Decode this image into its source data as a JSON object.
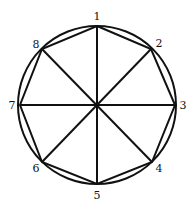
{
  "diagram": {
    "colors": {
      "stroke": "#111111",
      "background": "#ffffff"
    },
    "circle": {
      "cx": 97,
      "cy": 105,
      "r": 79
    },
    "center": {
      "x": 97,
      "y": 105
    },
    "vertices": [
      {
        "id": "1",
        "label": "1",
        "x": 97,
        "y": 26,
        "lx": 97,
        "ly": 20
      },
      {
        "id": "2",
        "label": "2",
        "x": 151,
        "y": 49,
        "lx": 159,
        "ly": 47
      },
      {
        "id": "3",
        "label": "3",
        "x": 175,
        "y": 105,
        "lx": 183,
        "ly": 109
      },
      {
        "id": "4",
        "label": "4",
        "x": 152,
        "y": 162,
        "lx": 159,
        "ly": 172
      },
      {
        "id": "5",
        "label": "5",
        "x": 97,
        "y": 184,
        "lx": 97,
        "ly": 199
      },
      {
        "id": "6",
        "label": "6",
        "x": 42,
        "y": 162,
        "lx": 36,
        "ly": 172
      },
      {
        "id": "7",
        "label": "7",
        "x": 20,
        "y": 105,
        "lx": 12,
        "ly": 109
      },
      {
        "id": "8",
        "label": "8",
        "x": 42,
        "y": 49,
        "lx": 36,
        "ly": 48
      }
    ]
  }
}
